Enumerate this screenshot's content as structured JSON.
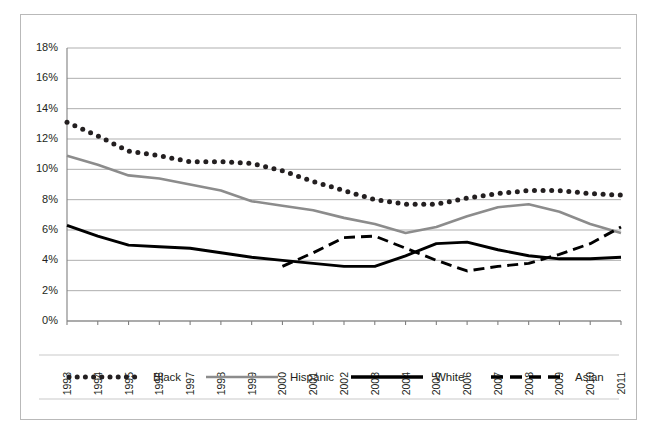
{
  "chart_data": {
    "type": "line",
    "title": "",
    "subtitle": "",
    "xlabel": "",
    "ylabel": "",
    "x": [
      "1993",
      "1994",
      "1995",
      "1996",
      "1997",
      "1998",
      "1999",
      "2000",
      "2001",
      "2002",
      "2003",
      "2004",
      "2005",
      "2006",
      "2007",
      "2008",
      "2009",
      "2010",
      "2011"
    ],
    "categories": [
      "1993",
      "1994",
      "1995",
      "1996",
      "1997",
      "1998",
      "1999",
      "2000",
      "2001",
      "2002",
      "2003",
      "2004",
      "2005",
      "2006",
      "2007",
      "2008",
      "2009",
      "2010",
      "2011"
    ],
    "ylim": [
      0,
      18
    ],
    "ytick_values": [
      0,
      2,
      4,
      6,
      8,
      10,
      12,
      14,
      16,
      18
    ],
    "ytick_labels": [
      "0%",
      "2%",
      "4%",
      "6%",
      "8%",
      "10%",
      "12%",
      "14%",
      "16%",
      "18%"
    ],
    "grid": "horizontal",
    "legend_position": "bottom",
    "series": [
      {
        "name": "Black",
        "style": "dotted",
        "color": "#231f20",
        "values": [
          13.1,
          12.2,
          11.2,
          10.9,
          10.5,
          10.5,
          10.4,
          9.9,
          9.2,
          8.6,
          8.0,
          7.7,
          7.7,
          8.1,
          8.4,
          8.6,
          8.6,
          8.4,
          8.3
        ]
      },
      {
        "name": "Hispanic",
        "style": "solid",
        "color": "#8c8c8c",
        "values": [
          10.9,
          10.3,
          9.6,
          9.4,
          9.0,
          8.6,
          7.9,
          7.6,
          7.3,
          6.8,
          6.4,
          5.8,
          6.2,
          6.9,
          7.5,
          7.7,
          7.2,
          6.4,
          5.8
        ]
      },
      {
        "name": "White",
        "style": "solid",
        "color": "#000000",
        "values": [
          6.3,
          5.6,
          5.0,
          4.9,
          4.8,
          4.5,
          4.2,
          4.0,
          3.8,
          3.6,
          3.6,
          4.3,
          5.1,
          5.2,
          4.7,
          4.3,
          4.1,
          4.1,
          4.2
        ]
      },
      {
        "name": "Asian",
        "style": "dashed",
        "color": "#000000",
        "values": [
          null,
          null,
          null,
          null,
          null,
          null,
          null,
          3.6,
          4.5,
          5.5,
          5.6,
          4.8,
          4.0,
          3.3,
          3.6,
          3.8,
          4.4,
          5.1,
          6.2
        ]
      }
    ],
    "series_black": [
      13.1,
      12.2,
      11.2,
      10.9,
      10.5,
      10.5,
      10.4,
      9.9,
      9.2,
      8.6,
      8.0,
      7.7,
      7.7,
      8.1,
      8.4,
      8.6,
      8.6,
      8.4,
      8.3
    ],
    "note": "values below restate each series in plotted order"
  },
  "plot": {
    "series": [
      {
        "name": "Black",
        "style": "dotted",
        "color": "#231f20",
        "values": [
          13.1,
          12.2,
          11.4,
          10.9,
          10.5,
          10.5,
          10.4,
          9.9,
          9.2,
          8.6,
          8.0,
          7.7,
          7.7,
          8.1,
          8.4,
          8.6,
          8.6,
          8.4,
          8.3
        ]
      }
    ]
  },
  "legend": {
    "items": [
      {
        "label": "Black",
        "marker": "dotted-line-swatch",
        "color": "#231f20"
      },
      {
        "label": "Hispanic",
        "marker": "solid-line-swatch",
        "color": "#8c8c8c"
      },
      {
        "label": "White",
        "marker": "solid-line-swatch",
        "color": "#000000"
      },
      {
        "label": "Asian",
        "marker": "dashed-line-swatch",
        "color": "#000000"
      }
    ]
  },
  "caption": {
    "text": ""
  }
}
